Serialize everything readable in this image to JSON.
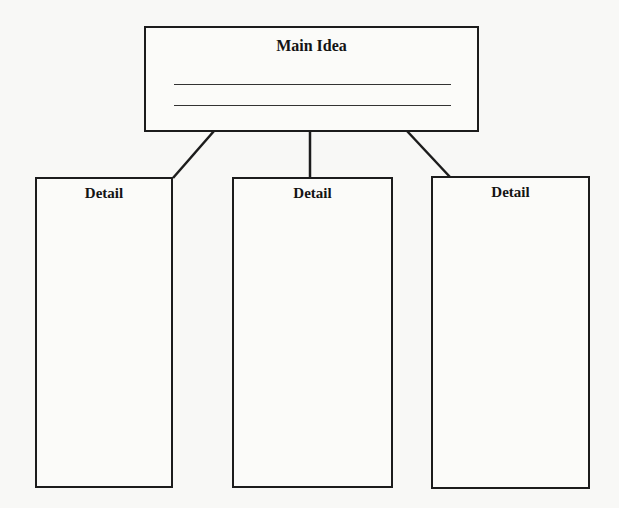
{
  "diagram": {
    "type": "graphic-organizer",
    "main": {
      "title": "Main Idea",
      "writing_lines": 2
    },
    "details": [
      {
        "title": "Detail"
      },
      {
        "title": "Detail"
      },
      {
        "title": "Detail"
      }
    ],
    "colors": {
      "line": "#1c1c1c",
      "background": "#f8f8f6"
    }
  }
}
